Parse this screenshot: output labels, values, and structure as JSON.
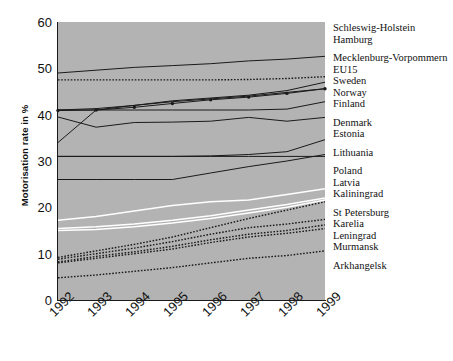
{
  "chart_data": {
    "type": "line",
    "title": "",
    "xlabel": "",
    "ylabel": "Motorisation rate in %",
    "categories": [
      "1992",
      "1993",
      "1994",
      "1995",
      "1996",
      "1997",
      "1998",
      "1999"
    ],
    "x": [
      1992,
      1993,
      1994,
      1995,
      1996,
      1997,
      1998,
      1999
    ],
    "ylim": [
      0,
      60
    ],
    "yticks": [
      0,
      10,
      20,
      30,
      40,
      50,
      60
    ],
    "grid": false,
    "legend_position": "right",
    "series": [
      {
        "name": "Schleswig-Holstein",
        "style": "solid-dark",
        "values": [
          49.0,
          49.6,
          50.2,
          50.6,
          51.0,
          51.6,
          52.0,
          52.6
        ]
      },
      {
        "name": "Hamburg",
        "style": "dotted-dark",
        "values": [
          47.5,
          47.5,
          47.5,
          47.5,
          47.5,
          47.6,
          47.8,
          48.2
        ]
      },
      {
        "name": "Mecklenburg-Vorpommern",
        "style": "solid-dark",
        "values": [
          34.0,
          41.0,
          42.0,
          43.0,
          43.6,
          44.2,
          45.2,
          47.0
        ]
      },
      {
        "name": "EU15",
        "style": "solid-dark",
        "values": [
          41.0,
          41.3,
          42.0,
          42.8,
          43.4,
          44.0,
          44.8,
          45.6
        ]
      },
      {
        "name": "Sweden",
        "style": "marker-dark",
        "values": [
          40.9,
          41.0,
          41.6,
          42.4,
          43.2,
          43.8,
          44.6,
          45.6
        ]
      },
      {
        "name": "Norway",
        "style": "solid-dark",
        "values": [
          41.0,
          41.0,
          41.0,
          41.0,
          41.0,
          41.0,
          41.2,
          42.8
        ]
      },
      {
        "name": "Finland",
        "style": "solid-dark",
        "values": [
          39.5,
          37.3,
          38.3,
          38.4,
          38.6,
          39.4,
          38.6,
          39.4
        ]
      },
      {
        "name": "Denmark",
        "style": "solid-dark",
        "values": [
          31.0,
          31.0,
          31.0,
          31.0,
          31.1,
          31.4,
          32.0,
          34.6
        ]
      },
      {
        "name": "Estonia",
        "style": "solid-dark",
        "values": [
          31.0,
          31.0,
          31.0,
          31.0,
          31.0,
          31.0,
          31.0,
          31.0
        ]
      },
      {
        "name": "Lithuania",
        "style": "solid-dark",
        "values": [
          26.0,
          26.0,
          26.0,
          26.0,
          27.4,
          28.8,
          30.0,
          31.4
        ]
      },
      {
        "name": "Poland",
        "style": "white",
        "values": [
          17.2,
          18.0,
          19.2,
          20.4,
          21.2,
          21.6,
          22.8,
          24.0
        ]
      },
      {
        "name": "Latvia",
        "style": "white",
        "values": [
          15.4,
          15.8,
          16.4,
          17.2,
          18.2,
          19.4,
          20.6,
          22.0
        ]
      },
      {
        "name": "Kaliningrad",
        "style": "white",
        "values": [
          15.0,
          15.2,
          15.8,
          16.6,
          17.6,
          18.8,
          20.0,
          21.6
        ]
      },
      {
        "name": "St Petersburg",
        "style": "dotted-dark",
        "values": [
          9.2,
          10.6,
          12.0,
          13.6,
          15.6,
          17.6,
          19.4,
          21.2
        ]
      },
      {
        "name": "Karelia",
        "style": "dotted-dark",
        "values": [
          8.8,
          10.0,
          11.2,
          12.6,
          14.2,
          15.6,
          16.4,
          17.4
        ]
      },
      {
        "name": "Leningrad",
        "style": "dotted-dark",
        "values": [
          8.2,
          9.4,
          10.4,
          11.6,
          13.0,
          14.2,
          15.0,
          16.2
        ]
      },
      {
        "name": "Murmansk",
        "style": "dotted-dark",
        "values": [
          8.0,
          9.0,
          10.0,
          11.0,
          12.4,
          13.6,
          14.4,
          15.4
        ]
      },
      {
        "name": "Arkhangelsk",
        "style": "dotted-dark",
        "values": [
          4.8,
          5.4,
          6.2,
          7.0,
          8.0,
          9.0,
          9.6,
          10.6
        ]
      }
    ]
  },
  "axes": {
    "y_title": "Motorisation rate in %",
    "y_ticks": [
      "60",
      "50",
      "40",
      "30",
      "20",
      "10",
      "0"
    ],
    "x_ticks": [
      "1992",
      "1993",
      "1994",
      "1995",
      "1996",
      "1997",
      "1998",
      "1999"
    ]
  },
  "legend": {
    "groups": [
      {
        "items": [
          "Schleswig-Holstein",
          "Hamburg"
        ]
      },
      {
        "items": [
          "Mecklenburg-Vorpommern",
          "EU15",
          "Sweden",
          "Norway",
          "Finland"
        ]
      },
      {
        "items": [
          "Denmark",
          "Estonia"
        ]
      },
      {
        "items": [
          "Lithuania"
        ]
      },
      {
        "items": [
          "Poland",
          "Latvia",
          "Kaliningrad"
        ]
      },
      {
        "items": [
          "St Petersburg",
          "Karelia",
          "Leningrad",
          "Murmansk"
        ]
      },
      {
        "items": [
          "Arkhangelsk"
        ]
      }
    ]
  },
  "colors": {
    "plot_background": "#b3b3b3",
    "line_dark": "#1a1a1a",
    "line_white": "#ffffff",
    "text": "#111111",
    "page_background": "#ffffff"
  }
}
